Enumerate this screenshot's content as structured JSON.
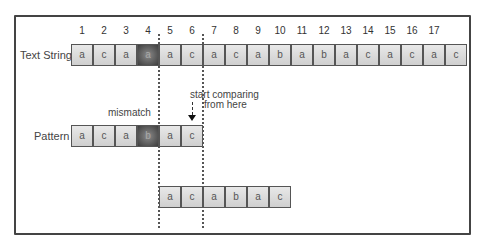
{
  "diagram": {
    "text_label": "Text String",
    "pattern_label": "Pattern",
    "indices": [
      "1",
      "2",
      "3",
      "4",
      "5",
      "6",
      "7",
      "8",
      "9",
      "10",
      "11",
      "12",
      "13",
      "14",
      "15",
      "16",
      "17"
    ],
    "text_cells": [
      "a",
      "c",
      "a",
      "a",
      "a",
      "c",
      "a",
      "c",
      "a",
      "b",
      "a",
      "b",
      "a",
      "c",
      "a",
      "c",
      "a",
      "c"
    ],
    "text_highlight_index": 3,
    "pattern_cells": [
      "a",
      "c",
      "a",
      "b",
      "a",
      "c"
    ],
    "pattern_highlight_index": 3,
    "shifted_pattern_cells": [
      "a",
      "c",
      "a",
      "b",
      "a",
      "c"
    ],
    "mismatch_label": "mismatch",
    "start_label_line1": "start comparing",
    "start_label_line2": "from here",
    "colors": {
      "cell_fill": "#d9d9d9",
      "highlight_fill": "#555555",
      "border": "#444444"
    }
  }
}
